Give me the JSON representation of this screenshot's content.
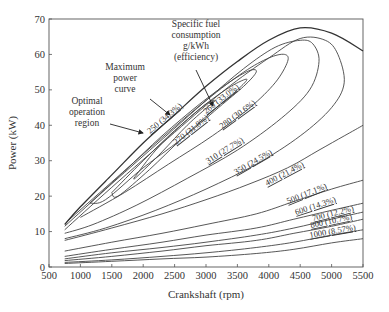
{
  "chart_data": {
    "type": "line",
    "title": "",
    "xlabel": "Crankshaft (rpm)",
    "ylabel": "Power (kW)",
    "xlim": [
      500,
      5500
    ],
    "ylim": [
      0,
      70
    ],
    "x_ticks": [
      500,
      1000,
      1500,
      2000,
      2500,
      3000,
      3500,
      4000,
      4500,
      5000,
      5500
    ],
    "y_ticks": [
      0,
      10,
      20,
      30,
      40,
      50,
      60,
      70
    ],
    "grid": false,
    "annotations": [
      {
        "text": [
          "Specific fuel",
          "consumption",
          "g/kWh",
          "(efficiency)"
        ],
        "points_to": "260 (33.0%) contour"
      },
      {
        "text": [
          "Maximum",
          "power",
          "curve"
        ],
        "points_to": "maximum power curve"
      },
      {
        "text": [
          "Optimal",
          "operation",
          "region"
        ],
        "points_to": "250 (34.3%) contour"
      }
    ],
    "max_power_curve": {
      "name": "Maximum power curve",
      "points": [
        [
          750,
          12
        ],
        [
          1000,
          17
        ],
        [
          1500,
          26
        ],
        [
          2000,
          35
        ],
        [
          2500,
          43
        ],
        [
          3000,
          51
        ],
        [
          3500,
          58
        ],
        [
          4000,
          64
        ],
        [
          4500,
          67.5
        ],
        [
          5000,
          66
        ],
        [
          5500,
          61
        ]
      ]
    },
    "series": [
      {
        "name": "250 (34.3%)",
        "sfc_g_per_kWh": 250,
        "efficiency_pct": 34.3,
        "closed": true,
        "points": [
          [
            1850,
            25
          ],
          [
            2200,
            33
          ],
          [
            2600,
            40
          ],
          [
            3000,
            46
          ],
          [
            3150,
            47
          ],
          [
            3050,
            45.5
          ],
          [
            2700,
            40
          ],
          [
            2300,
            32.5
          ],
          [
            1900,
            25.5
          ],
          [
            1850,
            25
          ]
        ]
      },
      {
        "name": "270 (31.8%)",
        "sfc_g_per_kWh": 270,
        "efficiency_pct": 31.8,
        "closed": true,
        "points": [
          [
            1500,
            21
          ],
          [
            2000,
            30
          ],
          [
            2500,
            38.5
          ],
          [
            3000,
            46
          ],
          [
            3400,
            51
          ],
          [
            3650,
            53
          ],
          [
            3500,
            50
          ],
          [
            3100,
            44
          ],
          [
            2600,
            36
          ],
          [
            2100,
            27.5
          ],
          [
            1600,
            20
          ],
          [
            1500,
            21
          ]
        ]
      },
      {
        "name": "260 (33.0%)",
        "sfc_g_per_kWh": 260,
        "efficiency_pct": 33.0,
        "closed": true,
        "points": [
          [
            1150,
            18
          ],
          [
            1700,
            27
          ],
          [
            2300,
            37
          ],
          [
            2900,
            46
          ],
          [
            3400,
            52.5
          ],
          [
            3700,
            55.5
          ],
          [
            3800,
            55
          ],
          [
            3600,
            51
          ],
          [
            3200,
            45
          ],
          [
            2600,
            36
          ],
          [
            2000,
            28
          ],
          [
            1400,
            19
          ],
          [
            1150,
            18
          ]
        ]
      },
      {
        "name": "280 (30.6%)",
        "sfc_g_per_kWh": 280,
        "efficiency_pct": 30.6,
        "closed": false,
        "points": [
          [
            800,
            13
          ],
          [
            1500,
            24
          ],
          [
            2200,
            35
          ],
          [
            3000,
            47
          ],
          [
            3600,
            55
          ],
          [
            4000,
            59
          ],
          [
            4250,
            60
          ],
          [
            4300,
            58
          ],
          [
            4100,
            52
          ],
          [
            3700,
            45
          ],
          [
            3100,
            37
          ],
          [
            2400,
            29
          ],
          [
            1700,
            21
          ],
          [
            1000,
            14
          ]
        ]
      },
      {
        "name": "310 (27.7%)",
        "sfc_g_per_kWh": 310,
        "efficiency_pct": 27.7,
        "closed": false,
        "points": [
          [
            750,
            11.5
          ],
          [
            1500,
            23.5
          ],
          [
            2300,
            36
          ],
          [
            3000,
            47
          ],
          [
            3600,
            56
          ],
          [
            4100,
            62
          ],
          [
            4500,
            64
          ],
          [
            4700,
            63
          ],
          [
            4800,
            58
          ],
          [
            4650,
            50
          ],
          [
            4200,
            42
          ],
          [
            3500,
            33
          ],
          [
            2700,
            25
          ],
          [
            1900,
            17.5
          ],
          [
            1200,
            12
          ],
          [
            750,
            9.5
          ]
        ]
      },
      {
        "name": "350 (24.5%)",
        "sfc_g_per_kWh": 350,
        "efficiency_pct": 24.5,
        "closed": false,
        "points": [
          [
            750,
            10.5
          ],
          [
            1500,
            22.5
          ],
          [
            2500,
            38
          ],
          [
            3300,
            50
          ],
          [
            4000,
            59
          ],
          [
            4500,
            64.5
          ],
          [
            4900,
            64
          ],
          [
            5100,
            60
          ],
          [
            5200,
            52
          ],
          [
            5000,
            45
          ],
          [
            4500,
            37
          ],
          [
            3800,
            29
          ],
          [
            3000,
            22
          ],
          [
            2200,
            16
          ],
          [
            1400,
            11
          ],
          [
            750,
            8
          ]
        ]
      },
      {
        "name": "400 (21.4%)",
        "sfc_g_per_kWh": 400,
        "efficiency_pct": 21.4,
        "closed": false,
        "points": [
          [
            750,
            7.5
          ],
          [
            1500,
            11
          ],
          [
            2300,
            15
          ],
          [
            3000,
            19
          ],
          [
            3700,
            23.5
          ],
          [
            4300,
            28
          ],
          [
            4800,
            33
          ],
          [
            5200,
            37
          ],
          [
            5500,
            40
          ]
        ]
      },
      {
        "name": "500 (17.1%)",
        "sfc_g_per_kWh": 500,
        "efficiency_pct": 17.1,
        "closed": false,
        "points": [
          [
            750,
            4.5
          ],
          [
            1500,
            7
          ],
          [
            2300,
            9.5
          ],
          [
            3000,
            12
          ],
          [
            3800,
            15
          ],
          [
            4400,
            18.5
          ],
          [
            5000,
            22
          ],
          [
            5500,
            24.5
          ]
        ]
      },
      {
        "name": "600 (14.3%)",
        "sfc_g_per_kWh": 600,
        "efficiency_pct": 14.3,
        "closed": false,
        "points": [
          [
            750,
            3
          ],
          [
            1500,
            5
          ],
          [
            2300,
            7
          ],
          [
            3000,
            9
          ],
          [
            3800,
            11
          ],
          [
            4400,
            13.5
          ],
          [
            5000,
            16
          ],
          [
            5500,
            18
          ]
        ]
      },
      {
        "name": "700 (12.2%)",
        "sfc_g_per_kWh": 700,
        "efficiency_pct": 12.2,
        "closed": false,
        "points": [
          [
            750,
            2.3
          ],
          [
            1500,
            4
          ],
          [
            2300,
            5.5
          ],
          [
            3000,
            7
          ],
          [
            3800,
            9
          ],
          [
            4400,
            11
          ],
          [
            5000,
            13.5
          ],
          [
            5500,
            15.5
          ]
        ]
      },
      {
        "name": "800 (10.7%)",
        "sfc_g_per_kWh": 800,
        "efficiency_pct": 10.7,
        "closed": false,
        "points": [
          [
            750,
            1.8
          ],
          [
            1500,
            3
          ],
          [
            2300,
            4.5
          ],
          [
            3000,
            6
          ],
          [
            3800,
            7.5
          ],
          [
            4400,
            9.5
          ],
          [
            5000,
            11.5
          ],
          [
            5500,
            13.5
          ]
        ]
      },
      {
        "name": "1000 (8.57%)",
        "sfc_g_per_kWh": 1000,
        "efficiency_pct": 8.57,
        "closed": false,
        "points": [
          [
            750,
            1.3
          ],
          [
            1500,
            2
          ],
          [
            2300,
            3
          ],
          [
            3000,
            4
          ],
          [
            3800,
            5.5
          ],
          [
            4400,
            7
          ],
          [
            5000,
            9
          ],
          [
            5500,
            10.5
          ]
        ]
      }
    ],
    "extra_unlabeled_contours": [
      {
        "points": [
          [
            750,
            1
          ],
          [
            1500,
            1.6
          ],
          [
            2300,
            2.3
          ],
          [
            3000,
            2.8
          ],
          [
            3800,
            3.8
          ],
          [
            4400,
            5
          ],
          [
            5000,
            6.8
          ],
          [
            5500,
            8
          ]
        ]
      }
    ],
    "label_positions": [
      {
        "text": "250 (34.3%)",
        "x": 150,
        "y": 134,
        "angle": -40
      },
      {
        "text": "270 (31.8%)",
        "x": 176,
        "y": 145,
        "angle": -38
      },
      {
        "text": "260 (33.0%)",
        "x": 206,
        "y": 114,
        "angle": -38
      },
      {
        "text": "280 (30.6%)",
        "x": 222,
        "y": 129,
        "angle": -36
      },
      {
        "text": "310 (27.7%)",
        "x": 208,
        "y": 164,
        "angle": -32
      },
      {
        "text": "350 (24.5%)",
        "x": 236,
        "y": 175,
        "angle": -30
      },
      {
        "text": "400 (21.4%)",
        "x": 267,
        "y": 186,
        "angle": -28
      },
      {
        "text": "500 (17.1%)",
        "x": 288,
        "y": 204,
        "angle": -22
      },
      {
        "text": "600 (14.3%)",
        "x": 296,
        "y": 215,
        "angle": -18
      },
      {
        "text": "700 (12.2%)",
        "x": 313,
        "y": 221,
        "angle": -14
      },
      {
        "text": "800 (10.7%)",
        "x": 311,
        "y": 228,
        "angle": -12
      },
      {
        "text": "1000 (8.57%)",
        "x": 310,
        "y": 238,
        "angle": -10
      }
    ]
  },
  "plot_area": {
    "left": 49,
    "right": 363,
    "top": 19,
    "bottom": 267
  }
}
